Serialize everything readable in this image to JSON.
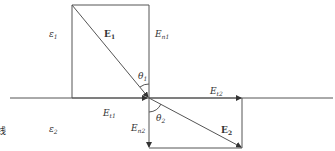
{
  "diagram": {
    "regions": {
      "upper_medium": "ε",
      "upper_medium_sub": "1",
      "lower_medium": "ε",
      "lower_medium_sub": "2"
    },
    "vectors": {
      "E1": {
        "base": "E",
        "sub": "1"
      },
      "E2": {
        "base": "E",
        "sub": "2"
      }
    },
    "components": {
      "En1": {
        "base": "E",
        "sub": "n1"
      },
      "Et1": {
        "base": "E",
        "sub": "t1"
      },
      "Et2": {
        "base": "E",
        "sub": "t2"
      },
      "En2": {
        "base": "E",
        "sub": "n2"
      }
    },
    "angles": {
      "theta1": {
        "base": "θ",
        "sub": "1"
      },
      "theta2": {
        "base": "θ",
        "sub": "2"
      }
    },
    "edge_text": "线",
    "colors": {
      "line": "#555555",
      "text": "#333333"
    }
  }
}
